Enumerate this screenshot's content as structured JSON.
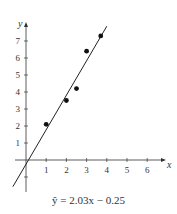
{
  "chart_data": {
    "type": "scatter",
    "title": "",
    "xlabel": "x",
    "ylabel": "y",
    "xlim": [
      -1,
      6.5
    ],
    "ylim": [
      -2,
      8
    ],
    "x_ticks": [
      1,
      2,
      3,
      4,
      5,
      6
    ],
    "y_ticks": [
      -1,
      1,
      2,
      3,
      4,
      5,
      6,
      7
    ],
    "grid": false,
    "series": [
      {
        "name": "data points",
        "type": "scatter",
        "x": [
          1,
          2,
          2.5,
          3,
          3.7
        ],
        "y": [
          2.1,
          3.5,
          4.2,
          6.4,
          7.3
        ]
      },
      {
        "name": "regression line",
        "type": "line",
        "slope": 2.03,
        "intercept": -0.25
      }
    ],
    "annotation": "ŷ = 2.03x − 0.25"
  },
  "caption": "ŷ = 2.03x − 0.25",
  "axis": {
    "x_label": "x",
    "y_label": "y"
  }
}
